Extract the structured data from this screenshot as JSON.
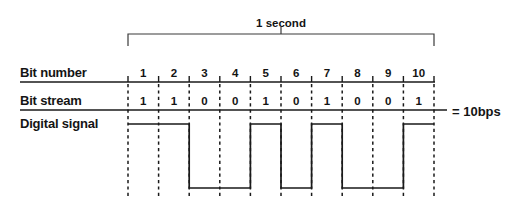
{
  "duration": {
    "label": "1 second",
    "bracket_start_x": 128,
    "bracket_end_x": 434
  },
  "rows": {
    "bit_number_label": "Bit number",
    "bit_stream_label": "Bit stream",
    "digital_signal_label": "Digital signal"
  },
  "rate": {
    "label": "= 10bps"
  },
  "chart_data": {
    "type": "line",
    "xlabel": "Bit number",
    "ylabel": "Digital signal level",
    "grid": true,
    "legend": false,
    "annotations": [
      "1 second",
      "= 10bps"
    ],
    "categories": [
      "1",
      "2",
      "3",
      "4",
      "5",
      "6",
      "7",
      "8",
      "9",
      "10"
    ],
    "bit_numbers": [
      1,
      2,
      3,
      4,
      5,
      6,
      7,
      8,
      9,
      10
    ],
    "bit_stream": [
      1,
      1,
      0,
      0,
      1,
      0,
      1,
      0,
      0,
      1
    ],
    "bit_stream_text": [
      "1",
      "1",
      "0",
      "0",
      "1",
      "0",
      "1",
      "0",
      "0",
      "1"
    ],
    "series": [
      {
        "name": "Digital signal",
        "values": [
          1,
          1,
          0,
          0,
          1,
          0,
          1,
          0,
          0,
          1
        ]
      }
    ],
    "ylim": [
      0,
      1
    ],
    "xlim": [
      0,
      10
    ],
    "cell_width_px": 30.6,
    "signal_high_y_px": 124,
    "signal_low_y_px": 188
  },
  "geometry": {
    "grid_left_x": 128,
    "grid_right_x": 434,
    "rule1_y": 82,
    "rule2_y": 110,
    "rule1_left_x": 20,
    "rule1_right_x": 435,
    "rule2_left_x": 20,
    "rule2_right_x": 447,
    "dash_top_y": 84,
    "dash_bottom_y": 196
  },
  "colors": {
    "ink": "#1a1a1a",
    "background": "#ffffff",
    "bracket": "#3a3a3a"
  }
}
